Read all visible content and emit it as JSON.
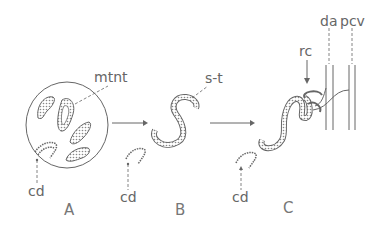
{
  "diagram": {
    "type": "developmental stages of kidney tubules",
    "panels": [
      {
        "id": "A",
        "label": "A"
      },
      {
        "id": "B",
        "label": "B"
      },
      {
        "id": "C",
        "label": "C"
      }
    ],
    "labels": {
      "mtnt": "mtnt",
      "st": "s-t",
      "cd_a": "cd",
      "cd_b": "cd",
      "cd_c": "cd",
      "rc": "rc",
      "da": "da",
      "pcv": "pcv"
    },
    "colors": {
      "stroke": "#666666",
      "fill": "#d8d8d8",
      "background": "#ffffff"
    }
  }
}
